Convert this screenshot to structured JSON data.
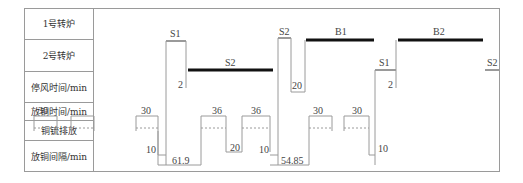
{
  "rows": [
    {
      "label": "1号转炉"
    },
    {
      "label": "2号转炉"
    },
    {
      "label": "停风时间/min"
    },
    {
      "label": "放铜时间/min"
    },
    {
      "label": "铜锍排放"
    },
    {
      "label": "放铜间隔/min"
    }
  ],
  "converter1": {
    "stages": [
      {
        "label": "S1"
      },
      {
        "label": "S2"
      },
      {
        "label": "B1"
      },
      {
        "label": "S1"
      },
      {
        "label": "B2"
      }
    ]
  },
  "converter2": {
    "stages": [
      {
        "label": "S2"
      },
      {
        "label": "S1"
      },
      {
        "label": "S2"
      }
    ]
  },
  "stop_times": [
    "2",
    "20",
    "2"
  ],
  "tap_times": [
    "30",
    "30",
    "36",
    "36",
    "30",
    "30"
  ],
  "short_gaps": [
    "10",
    "20",
    "10",
    "10"
  ],
  "intervals": [
    "61.9",
    "54.85"
  ],
  "colors": {
    "line": "#9a9a9a",
    "bar": "#111111",
    "text": "#444444"
  }
}
